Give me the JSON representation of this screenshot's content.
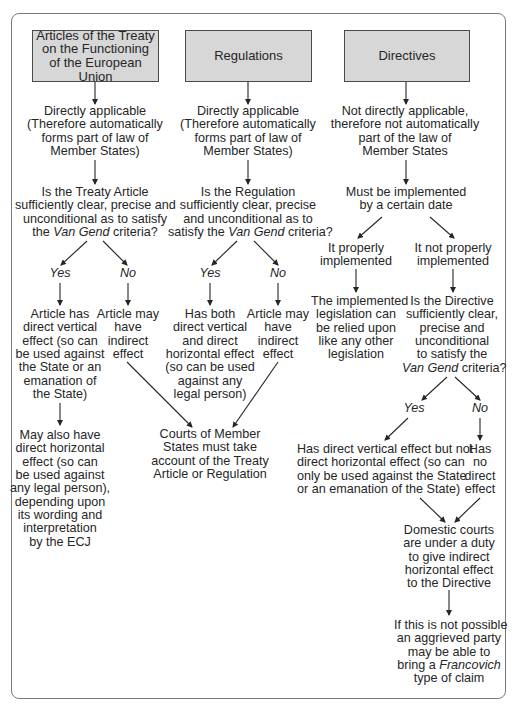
{
  "columns": {
    "treaty": {
      "header": [
        "Articles of the Treaty",
        "on the Functioning",
        "of the European Union"
      ],
      "applicability": [
        "Directly applicable",
        "(Therefore automatically",
        "forms part of law of",
        "Member States)"
      ],
      "question": {
        "l1": "Is the Treaty Article",
        "l2": "sufficiently clear, precise and",
        "l3": "unconditional as to satisfy",
        "l4a": "the ",
        "l4b": "Van Gend",
        "l4c": " criteria?"
      },
      "yes_label": "Yes",
      "no_label": "No",
      "yes_outcome": [
        "Article has",
        "direct vertical",
        "effect (so can",
        "be used against",
        "the State or an",
        "emanation of",
        "the State)"
      ],
      "no_outcome": [
        "Article may",
        "have",
        "indirect",
        "effect"
      ],
      "further": [
        "May also have",
        "direct horizontal",
        "effect (so can",
        "be used against",
        "any legal person),",
        "depending upon",
        "its wording and",
        "interpretation",
        "by the ECJ"
      ]
    },
    "regulations": {
      "header": "Regulations",
      "applicability": [
        "Directly applicable",
        "(Therefore automatically",
        "forms part of law of",
        "Member States)"
      ],
      "question": {
        "l1": "Is the Regulation",
        "l2": "sufficiently clear, precise",
        "l3": "and unconditional as to",
        "l4a": "satisfy the ",
        "l4b": "Van Gend",
        "l4c": " criteria?"
      },
      "yes_label": "Yes",
      "no_label": "No",
      "yes_outcome": [
        "Has both",
        "direct vertical",
        "and direct",
        "horizontal effect",
        "(so can be used",
        "against any",
        "legal person)"
      ],
      "no_outcome": [
        "Article may",
        "have",
        "indirect",
        "effect"
      ]
    },
    "courts": [
      "Courts of Member",
      "States must take",
      "account of the Treaty",
      "Article or Regulation"
    ],
    "directives": {
      "header": "Directives",
      "applicability": [
        "Not directly applicable,",
        "therefore not automatically",
        "part of the law of",
        "Member States"
      ],
      "implementation": [
        "Must be implemented",
        "by a certain date"
      ],
      "properly": [
        "It properly",
        "implemented"
      ],
      "not_properly": [
        "It not properly",
        "implemented"
      ],
      "properly_outcome": [
        "The implemented",
        "legislation can",
        "be relied upon",
        "like any other",
        "legislation"
      ],
      "question": {
        "l1": "Is the Directive",
        "l2": "sufficiently clear,",
        "l3": "precise and",
        "l4": "unconditional",
        "l5": "to satisfy the",
        "l6a": "Van Gend",
        "l6b": " criteria?"
      },
      "yes_label": "Yes",
      "no_label": "No",
      "yes_outcome": [
        "Has direct vertical effect but not",
        "direct horizontal effect (so can",
        "only be used against the State",
        "or an emanation of the State)"
      ],
      "no_outcome": [
        "Has",
        "no",
        "direct",
        "effect"
      ],
      "domestic": [
        "Domestic courts",
        "are under a duty",
        "to give indirect",
        "horizontal effect",
        "to the Directive"
      ],
      "final": {
        "l1": "If this is not possible",
        "l2": "an aggrieved party",
        "l3": "may be able to",
        "l4a": "bring a ",
        "l4b": "Francovich",
        "l5": "type of claim"
      }
    }
  },
  "colors": {
    "header_fill": "#d7d7d7",
    "header_border": "#4a4a4a",
    "frame_border": "#7a7a7a",
    "text": "#262626"
  }
}
